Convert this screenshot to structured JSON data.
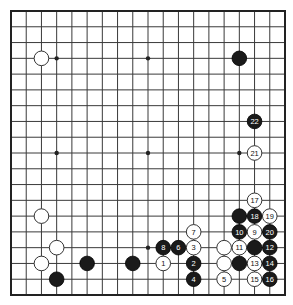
{
  "board": {
    "size": 19,
    "origin": {
      "x": 11,
      "y": 11
    },
    "end": {
      "x": 285,
      "y": 295
    },
    "colors": {
      "background": "#ffffff",
      "line": "#3a3a3a",
      "black": "#1a1a1a",
      "white": "#ffffff"
    },
    "star_points": [
      [
        3,
        3
      ],
      [
        9,
        3
      ],
      [
        15,
        3
      ],
      [
        3,
        9
      ],
      [
        9,
        9
      ],
      [
        15,
        9
      ],
      [
        3,
        15
      ],
      [
        9,
        15
      ],
      [
        15,
        15
      ]
    ],
    "stones": [
      {
        "c": 2,
        "r": 3,
        "color": "white",
        "label": ""
      },
      {
        "c": 15,
        "r": 3,
        "color": "black",
        "label": ""
      },
      {
        "c": 16,
        "r": 7,
        "color": "black",
        "label": "22"
      },
      {
        "c": 16,
        "r": 9,
        "color": "white",
        "label": "21"
      },
      {
        "c": 16,
        "r": 12,
        "color": "white",
        "label": "17"
      },
      {
        "c": 15,
        "r": 13,
        "color": "black",
        "label": ""
      },
      {
        "c": 16,
        "r": 13,
        "color": "black",
        "label": "18"
      },
      {
        "c": 17,
        "r": 13,
        "color": "white",
        "label": "19"
      },
      {
        "c": 15,
        "r": 14,
        "color": "black",
        "label": "10"
      },
      {
        "c": 16,
        "r": 14,
        "color": "white",
        "label": "9"
      },
      {
        "c": 17,
        "r": 14,
        "color": "black",
        "label": "20"
      },
      {
        "c": 14,
        "r": 15,
        "color": "white",
        "label": ""
      },
      {
        "c": 15,
        "r": 15,
        "color": "white",
        "label": "11"
      },
      {
        "c": 16,
        "r": 15,
        "color": "black",
        "label": ""
      },
      {
        "c": 17,
        "r": 15,
        "color": "black",
        "label": "12"
      },
      {
        "c": 14,
        "r": 16,
        "color": "white",
        "label": ""
      },
      {
        "c": 15,
        "r": 16,
        "color": "black",
        "label": ""
      },
      {
        "c": 16,
        "r": 16,
        "color": "white",
        "label": "13"
      },
      {
        "c": 17,
        "r": 16,
        "color": "black",
        "label": "14"
      },
      {
        "c": 14,
        "r": 17,
        "color": "white",
        "label": "5"
      },
      {
        "c": 16,
        "r": 17,
        "color": "white",
        "label": "15"
      },
      {
        "c": 17,
        "r": 17,
        "color": "black",
        "label": "16"
      },
      {
        "c": 12,
        "r": 14,
        "color": "white",
        "label": "7"
      },
      {
        "c": 10,
        "r": 15,
        "color": "black",
        "label": "8"
      },
      {
        "c": 11,
        "r": 15,
        "color": "black",
        "label": "6"
      },
      {
        "c": 12,
        "r": 15,
        "color": "white",
        "label": "3"
      },
      {
        "c": 10,
        "r": 16,
        "color": "white",
        "label": "1"
      },
      {
        "c": 12,
        "r": 16,
        "color": "black",
        "label": "2"
      },
      {
        "c": 12,
        "r": 17,
        "color": "black",
        "label": "4"
      },
      {
        "c": 2,
        "r": 13,
        "color": "white",
        "label": ""
      },
      {
        "c": 3,
        "r": 15,
        "color": "white",
        "label": ""
      },
      {
        "c": 2,
        "r": 16,
        "color": "white",
        "label": ""
      },
      {
        "c": 3,
        "r": 17,
        "color": "black",
        "label": ""
      },
      {
        "c": 5,
        "r": 16,
        "color": "black",
        "label": ""
      },
      {
        "c": 8,
        "r": 16,
        "color": "black",
        "label": ""
      }
    ]
  }
}
